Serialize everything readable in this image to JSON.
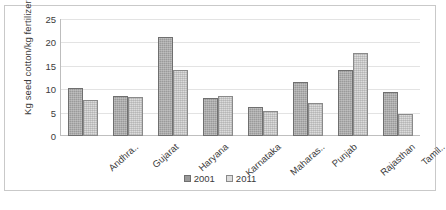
{
  "chart_data": {
    "type": "bar",
    "title": "",
    "xlabel": "",
    "ylabel": "Kg seed cotton/kg fertilizer",
    "ylim": [
      0,
      25
    ],
    "yticks": [
      0,
      5,
      10,
      15,
      20,
      25
    ],
    "grid": true,
    "legend_position": "bottom",
    "categories": [
      "Andhra..",
      "Gujarat",
      "Haryana",
      "Karnataka",
      "Maharas..",
      "Punjab",
      "Rajasthan",
      "Tamil.."
    ],
    "series": [
      {
        "name": "2001",
        "values": [
          10.3,
          8.5,
          21.2,
          8.2,
          6.3,
          11.6,
          14.2,
          9.5
        ]
      },
      {
        "name": "2011",
        "values": [
          7.6,
          8.3,
          14.0,
          8.5,
          5.3,
          7.0,
          17.8,
          4.6
        ]
      }
    ],
    "colors": {
      "s2001": "#9a9a9a",
      "s2011": "#dcdcdc",
      "border": "#6f6f6f",
      "grid": "#e3e3e3",
      "text": "#3b3b3b"
    }
  }
}
